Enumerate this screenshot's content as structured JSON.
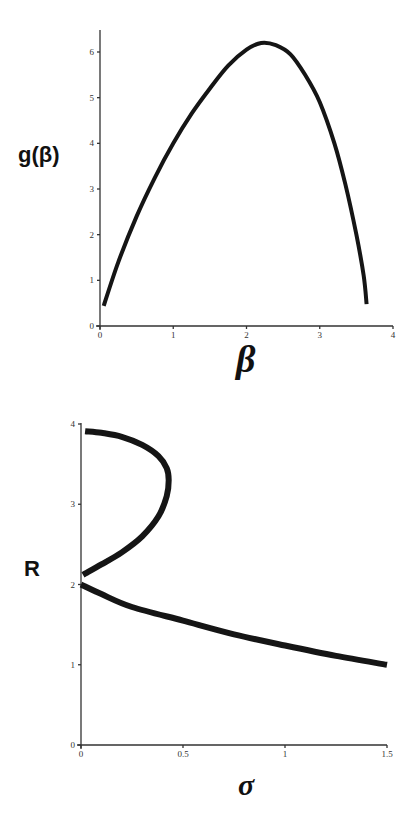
{
  "chart_data": [
    {
      "type": "line",
      "title": "",
      "xlabel": "β",
      "ylabel": "g(β)",
      "xlim": [
        0,
        4
      ],
      "ylim": [
        0,
        6.5
      ],
      "xticks": [
        "0",
        "1",
        "2",
        "3",
        "4"
      ],
      "yticks": [
        "0",
        "1",
        "2",
        "3",
        "4",
        "5",
        "6"
      ],
      "grid": false,
      "legend": null,
      "series": [
        {
          "name": "g(β)",
          "x": [
            0.05,
            0.25,
            0.5,
            0.75,
            1.0,
            1.25,
            1.5,
            1.75,
            2.0,
            2.2,
            2.4,
            2.6,
            2.8,
            3.0,
            3.2,
            3.35,
            3.5,
            3.6,
            3.64
          ],
          "y": [
            0.44,
            1.4,
            2.4,
            3.25,
            4.0,
            4.65,
            5.2,
            5.7,
            6.05,
            6.2,
            6.15,
            5.95,
            5.5,
            4.9,
            4.0,
            3.1,
            2.0,
            1.1,
            0.48
          ]
        }
      ]
    },
    {
      "type": "line",
      "title": "",
      "xlabel": "σ",
      "ylabel": "R",
      "xlim": [
        0,
        1.5
      ],
      "ylim": [
        0,
        4
      ],
      "xticks": [
        "0",
        "0.5",
        "1",
        "1.5"
      ],
      "yticks": [
        "0",
        "1",
        "2",
        "3",
        "4"
      ],
      "grid": false,
      "legend": null,
      "series": [
        {
          "name": "upper branch",
          "x": [
            0.02,
            0.1,
            0.2,
            0.3,
            0.38,
            0.42,
            0.43,
            0.42,
            0.38,
            0.3,
            0.2,
            0.1,
            0.01
          ],
          "y": [
            3.91,
            3.89,
            3.84,
            3.74,
            3.6,
            3.45,
            3.3,
            3.1,
            2.85,
            2.6,
            2.4,
            2.25,
            2.12
          ]
        },
        {
          "name": "lower branch",
          "x": [
            0.0,
            0.1,
            0.25,
            0.5,
            0.75,
            1.0,
            1.25,
            1.5
          ],
          "y": [
            2.0,
            1.88,
            1.72,
            1.55,
            1.38,
            1.24,
            1.11,
            1.0
          ]
        }
      ]
    }
  ]
}
